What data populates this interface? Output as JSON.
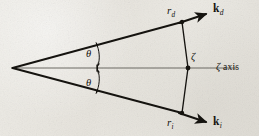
{
  "figure": {
    "kind": "scattering-geometry-diagram",
    "width": 259,
    "height": 136,
    "background_color": "#e8e6e0",
    "ink_color": "#15130f",
    "axis_color": "#5d5b56"
  },
  "labels": {
    "r_d": {
      "symbol": "r",
      "subscript": "d",
      "text": "rd"
    },
    "r_i": {
      "symbol": "r",
      "subscript": "i",
      "text": "ri"
    },
    "k_d": {
      "symbol": "k",
      "subscript": "d",
      "text": "kd"
    },
    "k_i": {
      "symbol": "k",
      "subscript": "i",
      "text": "ki"
    },
    "zeta_point": "ζ",
    "zeta_axis": "ζ axis",
    "zeta_axis_symbol": "ζ",
    "zeta_axis_word": "axis",
    "theta_upper": "θ",
    "theta_lower": "θ"
  },
  "geometry": {
    "apex": {
      "x": 12,
      "y": 68
    },
    "zeta_vertex": {
      "x": 188,
      "y": 68
    },
    "r_d_point": {
      "x": 182,
      "y": 22
    },
    "r_i_point": {
      "x": 182,
      "y": 113
    },
    "k_d_tip": {
      "x": 208,
      "y": 13
    },
    "k_i_tip": {
      "x": 208,
      "y": 123
    },
    "axis_end": {
      "x": 236,
      "y": 68
    },
    "angle_marker_x": 96,
    "theta_upper_degrees": 15,
    "theta_lower_degrees": 15
  }
}
